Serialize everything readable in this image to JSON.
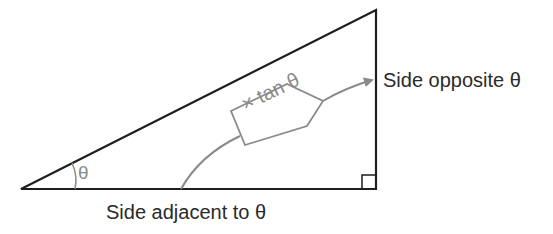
{
  "diagram": {
    "type": "right-triangle-trigonometry",
    "colors": {
      "triangle_stroke": "#1e1e1e",
      "annotation_gray": "#8a8a8a",
      "text": "#2a2a2a",
      "background": "#ffffff"
    },
    "labels": {
      "side_opposite": "Side opposite θ",
      "side_adjacent": "Side adjacent to θ",
      "angle": "θ",
      "multiplier_tag": "× tan θ"
    },
    "shapes": {
      "triangle_vertices": [
        [
          21,
          189
        ],
        [
          376,
          10
        ],
        [
          376,
          189
        ]
      ],
      "right_angle_marker": {
        "x": 361,
        "y": 175,
        "size": 14
      },
      "angle_arc": "at left vertex, marking θ",
      "arrow": "curved gray arrow from adjacent side, through tan θ tag, to opposite side"
    }
  }
}
